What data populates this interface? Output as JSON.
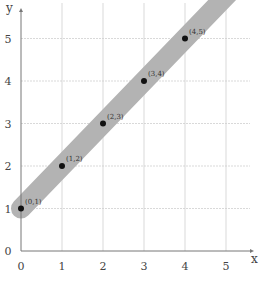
{
  "chart_data": {
    "type": "scatter",
    "title": "",
    "xlabel": "x",
    "ylabel": "y",
    "xlim": [
      0,
      5.5
    ],
    "ylim": [
      0,
      5.5
    ],
    "grid": true,
    "x_ticks": [
      "0",
      "1",
      "2",
      "3",
      "4",
      "5"
    ],
    "y_ticks": [
      "0",
      "1",
      "2",
      "3",
      "4",
      "5"
    ],
    "series": [
      {
        "name": "points",
        "x": [
          0,
          1,
          2,
          3,
          4
        ],
        "y": [
          1,
          2,
          3,
          4,
          5
        ],
        "labels": [
          "(0,1)",
          "(1,2)",
          "(2,3)",
          "(3,4)",
          "(4,5)"
        ]
      }
    ],
    "annotations": [
      {
        "type": "band",
        "description": "gray shaded band along line y = x + 1",
        "color": "#b3b3b3"
      }
    ]
  },
  "colors": {
    "band": "#b3b3b3",
    "grid": "#cfcfcf",
    "axis": "#777777",
    "point": "#111111"
  }
}
